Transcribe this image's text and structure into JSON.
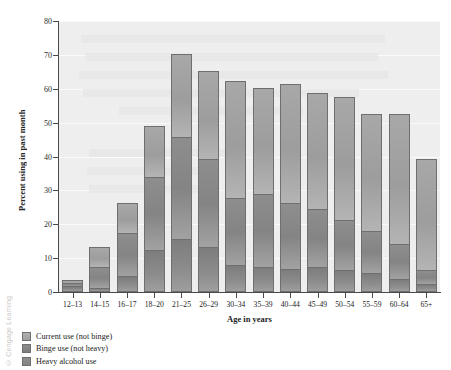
{
  "figure": {
    "credit": "© Cengage Learning"
  },
  "chart_data": {
    "type": "bar",
    "subtype": "stacked-vertical",
    "title": "",
    "xlabel": "Age in years",
    "ylabel": "Percent using in past month",
    "ylim": [
      0,
      80
    ],
    "yticks": [
      0,
      10,
      20,
      30,
      40,
      50,
      60,
      70,
      80
    ],
    "ytick_labels": [
      "0",
      "10",
      "20",
      "30",
      "40",
      "50",
      "60",
      "70",
      "80"
    ],
    "grid": true,
    "legend_position": "below-axes-left",
    "categories": [
      "12–13",
      "14–15",
      "16–17",
      "18–20",
      "21–25",
      "26–29",
      "30–34",
      "35–39",
      "40–44",
      "45–49",
      "50–54",
      "55–59",
      "60–64",
      "65+"
    ],
    "series": [
      {
        "name": "Heavy alcohol use",
        "color": "#8d8d8d",
        "values": [
          1.5,
          1.0,
          4.3,
          12.0,
          15.5,
          13.0,
          7.8,
          7.0,
          6.6,
          7.1,
          6.1,
          5.3,
          3.5,
          2.0
        ]
      },
      {
        "name": "Binge use (not heavy)",
        "color": "#8a8a8a",
        "values": [
          1.0,
          6.0,
          12.7,
          21.7,
          30.0,
          25.9,
          19.8,
          21.6,
          19.4,
          17.0,
          14.8,
          12.4,
          10.5,
          4.3
        ]
      },
      {
        "name": "Current use (not binge)",
        "color": "#a6a6a6",
        "values": [
          0.7,
          6.0,
          9.0,
          14.9,
          24.5,
          26.1,
          34.4,
          31.2,
          35.0,
          34.5,
          36.3,
          34.5,
          38.2,
          32.7
        ]
      }
    ],
    "totals": [
      3.2,
      13.0,
      26.0,
      48.6,
      70.0,
      65.0,
      62.0,
      59.8,
      61.0,
      58.6,
      57.2,
      52.2,
      52.2,
      39.0
    ],
    "annotations": []
  },
  "legend": {
    "items": [
      {
        "label": "Current use (not binge)",
        "swatch": "#a6a6a6"
      },
      {
        "label": "Binge use (not heavy)",
        "swatch": "#8a8a8a"
      },
      {
        "label": "Heavy alcohol use",
        "swatch": "#8d8d8d"
      }
    ]
  }
}
